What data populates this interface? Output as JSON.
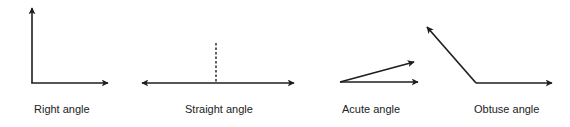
{
  "figure": {
    "type": "angle-types",
    "line_color": "#1e1e1e",
    "text_color": "#222222",
    "items": [
      {
        "id": "right",
        "label": "Right angle",
        "degrees": 90,
        "has_dashed_reference": false
      },
      {
        "id": "straight",
        "label": "Straight angle",
        "degrees": 180,
        "has_dashed_reference": true
      },
      {
        "id": "acute",
        "label": "Acute angle",
        "degrees": 15,
        "has_dashed_reference": false
      },
      {
        "id": "obtuse",
        "label": "Obtuse angle",
        "degrees": 130,
        "has_dashed_reference": false
      }
    ]
  }
}
